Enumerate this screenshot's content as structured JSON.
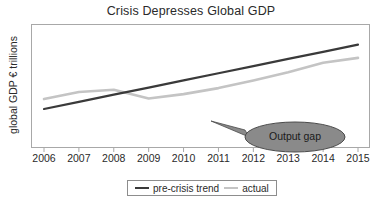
{
  "chart_data": {
    "type": "line",
    "title": "Crisis Depresses Global GDP",
    "xlabel": "",
    "ylabel": "global GDP € trillions",
    "x": [
      2006,
      2007,
      2008,
      2009,
      2010,
      2011,
      2012,
      2013,
      2014,
      2015
    ],
    "categories": [
      "2006",
      "2007",
      "2008",
      "2009",
      "2010",
      "2011",
      "2012",
      "2013",
      "2014",
      "2015"
    ],
    "xlim": [
      2006,
      2015
    ],
    "ylim": [
      0,
      100
    ],
    "grid": false,
    "legend_position": "bottom-center",
    "series": [
      {
        "name": "pre-crisis trend",
        "color": "#3a3a3a",
        "values": [
          30.0,
          36.5,
          43.0,
          49.5,
          56.0,
          62.5,
          69.0,
          75.5,
          82.0,
          88.5
        ]
      },
      {
        "name": "actual",
        "color": "#c4c4c4",
        "values": [
          39.0,
          45.5,
          47.5,
          39.5,
          43.5,
          49.0,
          56.0,
          63.5,
          72.0,
          76.5
        ]
      }
    ],
    "annotations": [
      {
        "name": "output-gap-callout",
        "text": "Output gap",
        "shape": "ellipse-with-pointer",
        "fill_color": "#8a8a8a",
        "border_color": "#4a4a4a",
        "pointer_target_x": 2011.4,
        "pointer_target_y": 26.5
      }
    ]
  },
  "legend": {
    "entries": [
      {
        "label": "pre-crisis trend",
        "color": "#3a3a3a"
      },
      {
        "label": "actual",
        "color": "#c4c4c4"
      }
    ]
  },
  "axis": {
    "y_title": "global GDP € trillions",
    "x_ticks": [
      "2006",
      "2007",
      "2008",
      "2009",
      "2010",
      "2011",
      "2012",
      "2013",
      "2014",
      "2015"
    ]
  },
  "header": {
    "title": "Crisis Depresses Global GDP"
  },
  "callout": {
    "label": "Output gap"
  },
  "colors": {
    "trend": "#3a3a3a",
    "actual": "#c4c4c4",
    "frame": "#a8a8a8",
    "callout_fill": "#8a8a8a",
    "background": "#ffffff"
  }
}
